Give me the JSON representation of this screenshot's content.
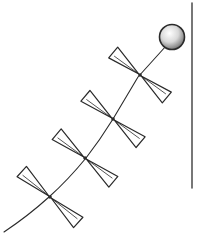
{
  "illustration": {
    "subject": "kite tail with bows hanging from a string beside a vertical pole",
    "bow_count": 4,
    "colors": {
      "ink": "#2a2a2a",
      "ball_shade": "#9a9a9a",
      "background": "#ffffff"
    }
  }
}
